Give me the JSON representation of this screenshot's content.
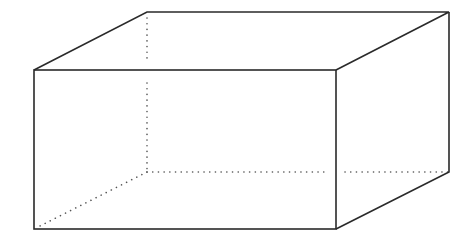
{
  "diagram": {
    "type": "rectangular-prism",
    "colors": {
      "edge": "#2a2a2a",
      "hidden_edge": "#555555",
      "background": "#ffffff"
    },
    "vertices": {
      "front_top_left": [
        34,
        70
      ],
      "front_top_right": [
        336,
        70
      ],
      "front_bottom_left": [
        34,
        229
      ],
      "front_bottom_right": [
        336,
        229
      ],
      "back_top_left": [
        147,
        12
      ],
      "back_top_right": [
        449,
        12
      ],
      "back_bottom_right": [
        449,
        172
      ],
      "back_bottom_left_hidden": [
        147,
        172
      ]
    },
    "labels": []
  }
}
